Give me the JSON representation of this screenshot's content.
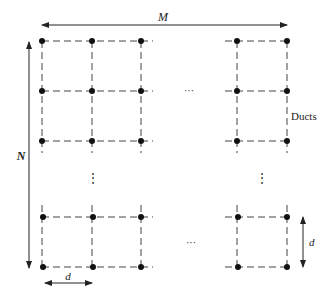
{
  "diagram": {
    "labels": {
      "width_dimension": "M",
      "height_dimension": "N",
      "spacing_horizontal": "d",
      "spacing_vertical": "d",
      "ducts": "Ducts",
      "ellipsis_horizontal": "···",
      "ellipsis_vertical": "⋮"
    },
    "grid": {
      "columns_x": [
        42,
        92,
        141,
        237,
        287
      ],
      "rows_y": [
        41,
        91,
        141,
        217,
        267
      ],
      "node_color": "#111111",
      "line_color": "#444444"
    }
  }
}
